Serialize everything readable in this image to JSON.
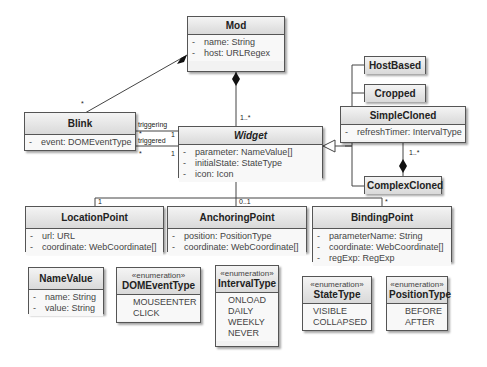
{
  "classes": {
    "mod": {
      "name": "Mod",
      "attrs": [
        {
          "vis": "-",
          "text": "name:  String"
        },
        {
          "vis": "-",
          "text": "host:  URLRegex"
        }
      ]
    },
    "widget": {
      "name": "Widget",
      "attrs": [
        {
          "vis": "-",
          "text": "parameter:  NameValue[]"
        },
        {
          "vis": "-",
          "text": "initialState:  StateType"
        },
        {
          "vis": "-",
          "text": "icon:  Icon"
        }
      ]
    },
    "blink": {
      "name": "Blink",
      "attrs": [
        {
          "vis": "-",
          "text": "event:  DOMEventType"
        }
      ]
    },
    "hostbased": {
      "name": "HostBased"
    },
    "cropped": {
      "name": "Cropped"
    },
    "simplecloned": {
      "name": "SimpleCloned",
      "attrs": [
        {
          "vis": "-",
          "text": "refreshTimer:  IntervalType"
        }
      ]
    },
    "complexcloned": {
      "name": "ComplexCloned"
    },
    "locationpoint": {
      "name": "LocationPoint",
      "attrs": [
        {
          "vis": "-",
          "text": "url:  URL"
        },
        {
          "vis": "-",
          "text": "coordinate:  WebCoordinate[]"
        }
      ]
    },
    "anchoringpoint": {
      "name": "AnchoringPoint",
      "attrs": [
        {
          "vis": "-",
          "text": "position:  PositionType"
        },
        {
          "vis": "-",
          "text": "coordinate:  WebCoordinate[]"
        }
      ]
    },
    "bindingpoint": {
      "name": "BindingPoint",
      "attrs": [
        {
          "vis": "-",
          "text": "parameterName:  String"
        },
        {
          "vis": "-",
          "text": "coordinate:  WebCoordinate[]"
        },
        {
          "vis": "-",
          "text": "regExp:  RegExp"
        }
      ]
    },
    "namevalue": {
      "name": "NameValue",
      "attrs": [
        {
          "vis": "-",
          "text": "name:  String"
        },
        {
          "vis": "-",
          "text": "value:  String"
        }
      ]
    }
  },
  "enums": {
    "stereotype": "«enumeration»",
    "domeventtype": {
      "name": "DOMEventType",
      "literals": [
        "MOUSEENTER",
        "CLICK"
      ]
    },
    "intervaltype": {
      "name": "IntervalType",
      "literals": [
        "ONLOAD",
        "DAILY",
        "WEEKLY",
        "NEVER"
      ]
    },
    "statetype": {
      "name": "StateType",
      "literals": [
        "VISIBLE",
        "COLLAPSED"
      ]
    },
    "positiontype": {
      "name": "PositionType",
      "literals": [
        "BEFORE",
        "AFTER"
      ]
    }
  },
  "labels": {
    "mod_widget_mult": "1..*",
    "mod_blink_mult": "*",
    "triggering": "triggering",
    "triggered": "triggered",
    "blink_star1": "*",
    "blink_star2": "*",
    "widget_one1": "1",
    "widget_one2": "1",
    "simple_complex_mult": "1..*",
    "location_mult": "1",
    "anchoring_mult": "0..1",
    "binding_mult": "*"
  }
}
